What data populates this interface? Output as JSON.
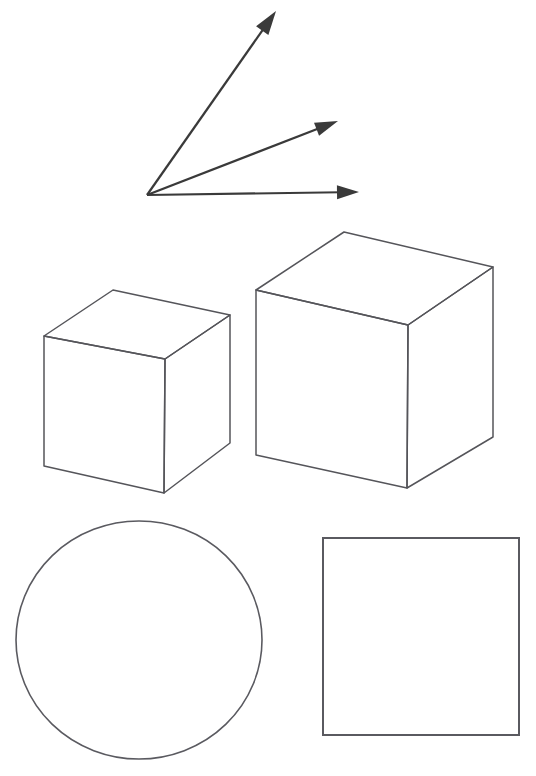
{
  "canvas": {
    "width": 536,
    "height": 776,
    "background_color": "#ffffff",
    "title": "Geometric Figures Line Drawing"
  },
  "style": {
    "arrow_stroke_color": "#3a3a3a",
    "arrow_head_color": "#3a3a3a",
    "arrow_stroke_width": 2.2,
    "cube_stroke_color": "#55555a",
    "cube_stroke_width": 1.5,
    "circle_stroke_color": "#5a5a60",
    "circle_stroke_width": 1.6,
    "square_stroke_color": "#5a5a60",
    "square_stroke_width": 2.0,
    "fill_color": "none"
  },
  "figures": {
    "arrow_group": {
      "name": "three-rays-from-common-origin",
      "origin": {
        "x": 147,
        "y": 195
      },
      "count": 3,
      "arrows": [
        {
          "label": "steep-arrow",
          "from": {
            "x": 147,
            "y": 195
          },
          "to": {
            "x": 276,
            "y": 11
          },
          "head_angle_deg": -55,
          "head_length": 24,
          "head_width": 15
        },
        {
          "label": "medium-arrow",
          "from": {
            "x": 147,
            "y": 195
          },
          "to": {
            "x": 338,
            "y": 121
          },
          "head_angle_deg": -21,
          "head_length": 23,
          "head_width": 14
        },
        {
          "label": "horizontal-arrow",
          "from": {
            "x": 147,
            "y": 195
          },
          "to": {
            "x": 359,
            "y": 192
          },
          "head_angle_deg": -1,
          "head_length": 22,
          "head_width": 14
        }
      ]
    },
    "small_cube": {
      "name": "small-cube",
      "vertices": {
        "top_back": {
          "x": 113,
          "y": 290
        },
        "top_left": {
          "x": 44,
          "y": 336
        },
        "top_right": {
          "x": 230,
          "y": 315
        },
        "top_front": {
          "x": 165,
          "y": 359
        },
        "bottom_left": {
          "x": 44,
          "y": 466
        },
        "bottom_front": {
          "x": 164,
          "y": 493
        },
        "bottom_right": {
          "x": 230,
          "y": 443
        }
      },
      "top_face": "113,290 44,336 165,359 230,315",
      "left_face": "44,336 44,466 164,493 165,359",
      "right_face": "165,359 164,493 230,443 230,315"
    },
    "large_cube": {
      "name": "large-cube",
      "vertices": {
        "top_back": {
          "x": 344,
          "y": 232
        },
        "top_left": {
          "x": 256,
          "y": 290
        },
        "top_right": {
          "x": 493,
          "y": 267
        },
        "top_front": {
          "x": 408,
          "y": 325
        },
        "bottom_left": {
          "x": 256,
          "y": 455
        },
        "bottom_front": {
          "x": 407,
          "y": 488
        },
        "bottom_right": {
          "x": 493,
          "y": 437
        }
      },
      "top_face": "344,232 256,290 408,325 493,267",
      "left_face": "256,290 256,455 407,488 408,325",
      "right_face": "408,325 407,488 493,437 493,267"
    },
    "circle": {
      "name": "circle",
      "center": {
        "x": 139,
        "y": 640
      },
      "radius_x": 123,
      "radius_y": 119,
      "bounds": {
        "left": 16,
        "top": 521,
        "right": 262,
        "bottom": 759
      }
    },
    "square": {
      "name": "square",
      "x": 323,
      "y": 538,
      "width": 196,
      "height": 197,
      "bounds": {
        "left": 323,
        "top": 538,
        "right": 519,
        "bottom": 735
      }
    }
  }
}
